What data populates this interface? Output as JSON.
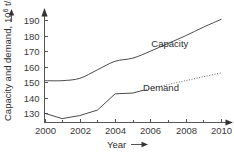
{
  "chart_data": {
    "type": "line",
    "title": "",
    "xlabel": "Year",
    "ylabel": "Capacity and demand, 10⁶ t/a",
    "ylabel_main": "Capacity and demand,",
    "ylabel_unit_base": "10",
    "ylabel_unit_exp": "6",
    "ylabel_unit_tail": " t/a",
    "x": [
      2000,
      2001,
      2002,
      2003,
      2004,
      2005,
      2006,
      2007,
      2008,
      2009,
      2010
    ],
    "xlim": [
      2000,
      2010
    ],
    "ylim": [
      124,
      194
    ],
    "xticks": [
      2000,
      2002,
      2004,
      2006,
      2008,
      2010
    ],
    "xtick_labels": [
      "2000",
      "2002",
      "2004",
      "2006",
      "2008",
      "2010"
    ],
    "xminorticks": [
      2001,
      2003,
      2005,
      2007,
      2009
    ],
    "yticks": [
      130,
      140,
      150,
      160,
      170,
      180,
      190
    ],
    "ytick_labels": [
      "130",
      "140",
      "150",
      "160",
      "170",
      "180",
      "190"
    ],
    "grid": false,
    "legend_position": "inline-annotation",
    "axis_arrows": {
      "x": "right",
      "y": "up"
    },
    "series": [
      {
        "name": "Capacity",
        "style": "solid",
        "color": "#4a4a4a",
        "label_x": 2007.1,
        "label_y": 172.5,
        "values": [
          151,
          151,
          152.5,
          158,
          163.5,
          165.5,
          170,
          175,
          180,
          185.5,
          190.5
        ]
      },
      {
        "name": "Demand",
        "style": "solid-then-dotted",
        "color": "#4a4a4a",
        "dotted_from": 2005.6,
        "label_x": 2006.6,
        "label_y": 144.5,
        "values": [
          130,
          126.5,
          128.5,
          132,
          142.5,
          143,
          146,
          148.5,
          151,
          153.5,
          156
        ]
      }
    ],
    "annotations": [
      {
        "text": "Capacity",
        "x": 2007.1,
        "y": 172.5
      },
      {
        "text": "Demand",
        "x": 2006.6,
        "y": 144.5
      }
    ]
  },
  "colors": {
    "background": "#ffffff",
    "axis": "#555555",
    "text": "#2e2e2e",
    "capacity_line": "#4a4a4a",
    "demand_line": "#4a4a4a",
    "demand_forecast": "#6a6a6a"
  },
  "figure": {
    "xlabel_arrow": "⟶",
    "ylabel_arrow": "⟶"
  }
}
